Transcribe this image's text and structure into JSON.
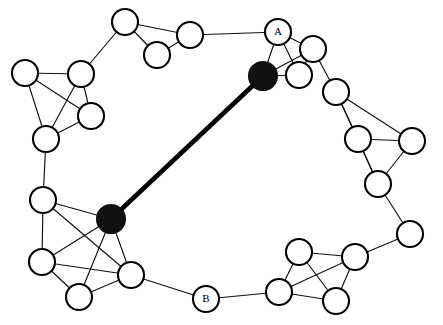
{
  "figure": {
    "background_color": "#ffffff",
    "width": 443,
    "height": 325
  },
  "style": {
    "node_fill_open": "#ffffff",
    "node_fill_highlight": "#111111",
    "node_stroke": "#000000",
    "edge_color": "#111111",
    "bridge_color": "#000000",
    "node_radius": 13,
    "hub_radius": 14,
    "edge_width": 1.15,
    "bridge_width": 4.6
  },
  "chart_data": {
    "type": "graph",
    "title": "",
    "directed": false,
    "node_count": 25,
    "edge_count": 43,
    "legend": [],
    "labels": {
      "a": "A",
      "b": "B"
    },
    "nodes": [
      {
        "id": "t1",
        "x": 125,
        "y": 22,
        "r": 13,
        "style": "open",
        "label": ""
      },
      {
        "id": "t2",
        "x": 190,
        "y": 35,
        "r": 13,
        "style": "open",
        "label": ""
      },
      {
        "id": "t3",
        "x": 157,
        "y": 55,
        "r": 13,
        "style": "open",
        "label": ""
      },
      {
        "id": "A",
        "x": 278,
        "y": 32,
        "r": 13,
        "style": "open",
        "label": "A"
      },
      {
        "id": "h1",
        "x": 263,
        "y": 76,
        "r": 14,
        "style": "highlight",
        "label": ""
      },
      {
        "id": "a2",
        "x": 313,
        "y": 49,
        "r": 13,
        "style": "open",
        "label": ""
      },
      {
        "id": "a3",
        "x": 299,
        "y": 75,
        "r": 13,
        "style": "open",
        "label": ""
      },
      {
        "id": "r1",
        "x": 336,
        "y": 92,
        "r": 13,
        "style": "open",
        "label": ""
      },
      {
        "id": "r2",
        "x": 358,
        "y": 139,
        "r": 13,
        "style": "open",
        "label": ""
      },
      {
        "id": "r3",
        "x": 412,
        "y": 141,
        "r": 13,
        "style": "open",
        "label": ""
      },
      {
        "id": "r4",
        "x": 378,
        "y": 184,
        "r": 13,
        "style": "open",
        "label": ""
      },
      {
        "id": "r5",
        "x": 410,
        "y": 234,
        "r": 13,
        "style": "open",
        "label": ""
      },
      {
        "id": "br1",
        "x": 355,
        "y": 257,
        "r": 13,
        "style": "open",
        "label": ""
      },
      {
        "id": "br2",
        "x": 299,
        "y": 252,
        "r": 13,
        "style": "open",
        "label": ""
      },
      {
        "id": "br3",
        "x": 279,
        "y": 292,
        "r": 13,
        "style": "open",
        "label": ""
      },
      {
        "id": "br4",
        "x": 336,
        "y": 301,
        "r": 13,
        "style": "open",
        "label": ""
      },
      {
        "id": "B",
        "x": 206,
        "y": 299,
        "r": 13,
        "style": "open",
        "label": "B"
      },
      {
        "id": "h2",
        "x": 111,
        "y": 219,
        "r": 14,
        "style": "highlight",
        "label": ""
      },
      {
        "id": "bl1",
        "x": 43,
        "y": 200,
        "r": 13,
        "style": "open",
        "label": ""
      },
      {
        "id": "bl2",
        "x": 42,
        "y": 262,
        "r": 13,
        "style": "open",
        "label": ""
      },
      {
        "id": "bl3",
        "x": 79,
        "y": 297,
        "r": 13,
        "style": "open",
        "label": ""
      },
      {
        "id": "bl4",
        "x": 131,
        "y": 275,
        "r": 13,
        "style": "open",
        "label": ""
      },
      {
        "id": "l1",
        "x": 25,
        "y": 73,
        "r": 13,
        "style": "open",
        "label": ""
      },
      {
        "id": "l2",
        "x": 81,
        "y": 74,
        "r": 13,
        "style": "open",
        "label": ""
      },
      {
        "id": "l3",
        "x": 91,
        "y": 116,
        "r": 13,
        "style": "open",
        "label": ""
      },
      {
        "id": "l4",
        "x": 46,
        "y": 139,
        "r": 13,
        "style": "open",
        "label": ""
      }
    ],
    "edges": [
      {
        "from": "t1",
        "to": "t2",
        "kind": "normal"
      },
      {
        "from": "t1",
        "to": "t3",
        "kind": "normal"
      },
      {
        "from": "t2",
        "to": "t3",
        "kind": "normal"
      },
      {
        "from": "t2",
        "to": "A",
        "kind": "normal"
      },
      {
        "from": "t1",
        "to": "l2",
        "kind": "normal"
      },
      {
        "from": "A",
        "to": "h1",
        "kind": "normal"
      },
      {
        "from": "A",
        "to": "a2",
        "kind": "normal"
      },
      {
        "from": "A",
        "to": "a3",
        "kind": "normal"
      },
      {
        "from": "h1",
        "to": "a2",
        "kind": "normal"
      },
      {
        "from": "h1",
        "to": "a3",
        "kind": "normal"
      },
      {
        "from": "a2",
        "to": "a3",
        "kind": "normal"
      },
      {
        "from": "a2",
        "to": "r1",
        "kind": "normal"
      },
      {
        "from": "r1",
        "to": "r2",
        "kind": "normal"
      },
      {
        "from": "r1",
        "to": "r3",
        "kind": "normal"
      },
      {
        "from": "r1",
        "to": "r4",
        "kind": "normal"
      },
      {
        "from": "r2",
        "to": "r3",
        "kind": "normal"
      },
      {
        "from": "r2",
        "to": "r4",
        "kind": "normal"
      },
      {
        "from": "r3",
        "to": "r4",
        "kind": "normal"
      },
      {
        "from": "r4",
        "to": "r5",
        "kind": "normal"
      },
      {
        "from": "r5",
        "to": "br1",
        "kind": "normal"
      },
      {
        "from": "br1",
        "to": "br2",
        "kind": "normal"
      },
      {
        "from": "br1",
        "to": "br3",
        "kind": "normal"
      },
      {
        "from": "br1",
        "to": "br4",
        "kind": "normal"
      },
      {
        "from": "br2",
        "to": "br3",
        "kind": "normal"
      },
      {
        "from": "br2",
        "to": "br4",
        "kind": "normal"
      },
      {
        "from": "br3",
        "to": "br4",
        "kind": "normal"
      },
      {
        "from": "br3",
        "to": "B",
        "kind": "normal"
      },
      {
        "from": "B",
        "to": "bl4",
        "kind": "normal"
      },
      {
        "from": "h2",
        "to": "bl1",
        "kind": "normal"
      },
      {
        "from": "h2",
        "to": "bl2",
        "kind": "normal"
      },
      {
        "from": "h2",
        "to": "bl3",
        "kind": "normal"
      },
      {
        "from": "h2",
        "to": "bl4",
        "kind": "normal"
      },
      {
        "from": "bl1",
        "to": "bl2",
        "kind": "normal"
      },
      {
        "from": "bl1",
        "to": "bl4",
        "kind": "normal"
      },
      {
        "from": "bl2",
        "to": "bl3",
        "kind": "normal"
      },
      {
        "from": "bl2",
        "to": "bl4",
        "kind": "normal"
      },
      {
        "from": "bl3",
        "to": "bl4",
        "kind": "normal"
      },
      {
        "from": "bl1",
        "to": "l4",
        "kind": "normal"
      },
      {
        "from": "l1",
        "to": "l2",
        "kind": "normal"
      },
      {
        "from": "l1",
        "to": "l3",
        "kind": "normal"
      },
      {
        "from": "l1",
        "to": "l4",
        "kind": "normal"
      },
      {
        "from": "l2",
        "to": "l3",
        "kind": "normal"
      },
      {
        "from": "l2",
        "to": "l4",
        "kind": "normal"
      },
      {
        "from": "l3",
        "to": "l4",
        "kind": "normal"
      },
      {
        "from": "h1",
        "to": "h2",
        "kind": "bridge"
      }
    ]
  }
}
